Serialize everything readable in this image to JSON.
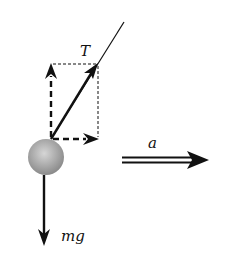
{
  "diagram": {
    "labels": {
      "tension": "T",
      "weight": "mg",
      "acceleration": "a"
    },
    "colors": {
      "line": "#111111",
      "ball_light": "#d6d6d6",
      "ball_dark": "#8a8a8a",
      "background": "#ffffff"
    },
    "elements": [
      {
        "name": "rope",
        "type": "line",
        "from": [
          51,
          139
        ],
        "to": [
          124,
          22
        ]
      },
      {
        "name": "tension-vector",
        "type": "arrow",
        "from": [
          51,
          139
        ],
        "to": [
          97,
          64
        ],
        "label": "T"
      },
      {
        "name": "tension-vertical-component",
        "type": "dashed-arrow",
        "from": [
          51,
          139
        ],
        "to": [
          51,
          64
        ]
      },
      {
        "name": "tension-horizontal-component",
        "type": "dashed-arrow",
        "from": [
          51,
          139
        ],
        "to": [
          98,
          139
        ]
      },
      {
        "name": "component-rectangle",
        "type": "dotted-rect",
        "x": [
          51,
          98
        ],
        "y": [
          64,
          139
        ]
      },
      {
        "name": "ball",
        "type": "circle",
        "center": [
          46,
          157
        ],
        "radius": 18
      },
      {
        "name": "weight-vector",
        "type": "arrow",
        "from": [
          44,
          175
        ],
        "to": [
          44,
          245
        ],
        "label": "mg"
      },
      {
        "name": "acceleration-vector",
        "type": "double-arrow",
        "from": [
          122,
          160
        ],
        "to": [
          208,
          160
        ],
        "label": "a"
      }
    ]
  }
}
